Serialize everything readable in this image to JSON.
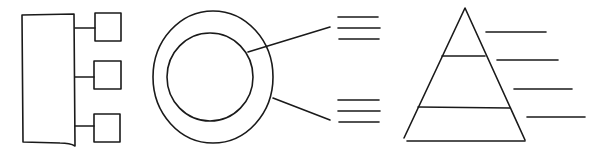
{
  "diagrams": [
    {
      "name": "hierarchy-block",
      "description": "Large rectangle connected to three small boxes",
      "child_count": 3
    },
    {
      "name": "concentric-circles",
      "description": "Two concentric circles with two leader lines pointing to text-line placeholders",
      "callouts": [
        {
          "target": "inner-circle",
          "placeholder_lines": 3
        },
        {
          "target": "outer-ring",
          "placeholder_lines": 3
        }
      ]
    },
    {
      "name": "pyramid",
      "description": "Triangle split into three tiers with four label placeholder lines on the right",
      "tiers": 3,
      "label_lines": 4
    }
  ],
  "colors": {
    "stroke": "#1a1a1a",
    "background": "#ffffff"
  }
}
